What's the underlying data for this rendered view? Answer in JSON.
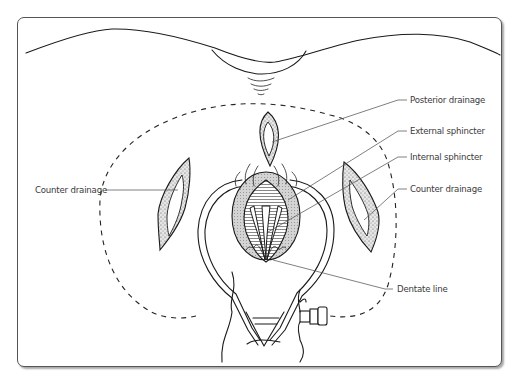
{
  "figure": {
    "type": "anatomical-illustration",
    "labels": [
      {
        "id": "posterior_drainage",
        "text": "Posterior drainage",
        "side": "right"
      },
      {
        "id": "external_sphincter",
        "text": "External sphincter",
        "side": "right"
      },
      {
        "id": "internal_sphincter",
        "text": "Internal sphincter",
        "side": "right"
      },
      {
        "id": "counter_drainage_right",
        "text": "Counter drainage",
        "side": "right"
      },
      {
        "id": "dentate_line",
        "text": "Dentate line",
        "side": "right"
      },
      {
        "id": "counter_drainage_left",
        "text": "Counter drainage",
        "side": "left"
      }
    ]
  },
  "colors": {
    "line": "#1a1a1a",
    "label_text": "#3a3a3a",
    "leader": "#555555",
    "frame_border": "#555555",
    "background": "#ffffff"
  }
}
